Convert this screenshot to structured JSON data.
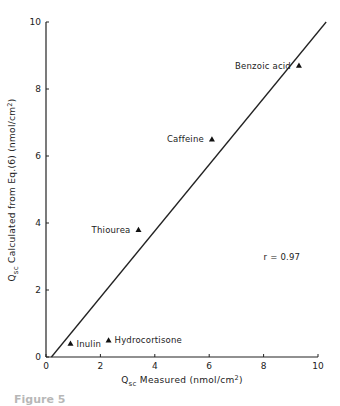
{
  "chart_data": {
    "type": "scatter",
    "title": "",
    "xlabel": "Q_sc Measured (nmol/cm²)",
    "ylabel": "Q_sc Calculated from Eq.(6) (nmol/cm²)",
    "xlim": [
      0,
      10
    ],
    "ylim": [
      0,
      10
    ],
    "x_ticks": [
      0,
      2,
      4,
      6,
      8,
      10
    ],
    "y_ticks": [
      0,
      2,
      4,
      6,
      8,
      10
    ],
    "grid": false,
    "legend": null,
    "marker": "triangle",
    "points": [
      {
        "label": "Inulin",
        "x": 0.9,
        "y": 0.4
      },
      {
        "label": "Hydrocortisone",
        "x": 2.3,
        "y": 0.5
      },
      {
        "label": "Thiourea",
        "x": 3.4,
        "y": 3.8
      },
      {
        "label": "Caffeine",
        "x": 6.1,
        "y": 6.5
      },
      {
        "label": "Benzoic acid",
        "x": 9.3,
        "y": 8.7
      }
    ],
    "fit_line": {
      "x": [
        0.2,
        10.3
      ],
      "y": [
        0.0,
        10.0
      ]
    },
    "annotations": [
      {
        "text": "r = 0.97",
        "x": 8.0,
        "y": 3.0
      }
    ]
  },
  "labels": {
    "x_axis_main": "Q",
    "x_axis_sub": "sc",
    "x_axis_rest": " Measured (nmol/cm",
    "x_axis_sup": "2",
    "x_axis_close": ")",
    "y_axis_main": "Q",
    "y_axis_sub": "sc",
    "y_axis_rest": " Calculated from Eq.(6) (nmol/cm",
    "y_axis_sup": "2",
    "y_axis_close": ")",
    "r_value": "r = 0.97",
    "caption": "Figure 5"
  }
}
